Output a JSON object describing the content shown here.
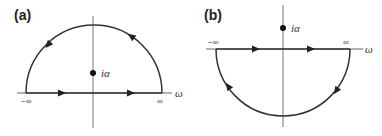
{
  "panels": [
    {
      "id": "a",
      "label": "(a)",
      "contour": "upper-half-plane semicircle",
      "pole_label": "iα",
      "neg_inf_label": "−∞",
      "pos_inf_label": "∞",
      "axis_label": "ω"
    },
    {
      "id": "b",
      "label": "(b)",
      "contour": "lower-half-plane semicircle",
      "pole_label": "iα",
      "neg_inf_label": "−∞",
      "pos_inf_label": "∞",
      "axis_label": "ω"
    }
  ],
  "colors": {
    "axis": "#555555",
    "contour": "#333333",
    "pole": "#111111"
  }
}
